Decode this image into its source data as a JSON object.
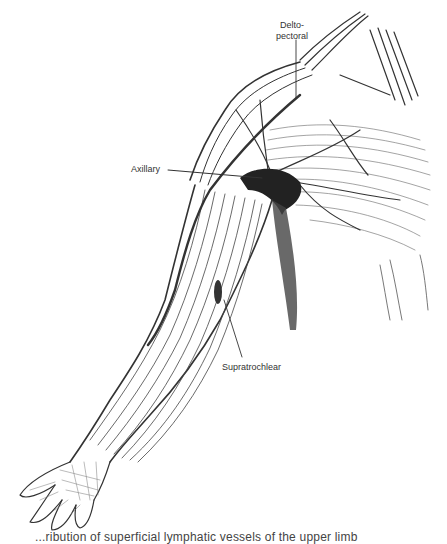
{
  "figure": {
    "labels": [
      {
        "id": "deltopectoral",
        "line1": "Delto-",
        "line2": "pectoral"
      },
      {
        "id": "axillary",
        "text": "Axillary"
      },
      {
        "id": "supratrochlear",
        "text": "Supratrochlear"
      }
    ],
    "caption_visible_fragment": "...ribution of superficial lymphatic vessels of the upper limb"
  },
  "colors": {
    "ink": "#2a2a2a",
    "background": "#ffffff",
    "shade": "#555555"
  }
}
